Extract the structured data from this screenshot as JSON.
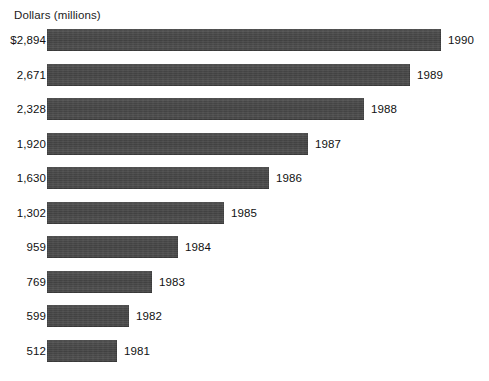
{
  "chart_data": {
    "type": "bar",
    "orientation": "horizontal",
    "title": "",
    "xlabel": "Dollars (millions)",
    "ylabel": "",
    "axis_title": "Dollars (millions)",
    "categories": [
      "1990",
      "1989",
      "1988",
      "1987",
      "1986",
      "1985",
      "1984",
      "1983",
      "1982",
      "1981"
    ],
    "values": [
      2894,
      2671,
      2328,
      1920,
      1630,
      1302,
      959,
      769,
      599,
      512
    ],
    "value_labels": [
      "$2,894",
      "2,671",
      "2,328",
      "1,920",
      "1,630",
      "1,302",
      "959",
      "769",
      "599",
      "512"
    ],
    "bar_labels": [
      "1990",
      "1989",
      "1988",
      "1987",
      "1986",
      "1985",
      "1984",
      "1983",
      "1982",
      "1981"
    ],
    "xlim": [
      0,
      2894
    ],
    "grid": false,
    "legend": null,
    "bar_color": "#4a4a4a",
    "text_color": "#111111",
    "background_color": "#ffffff"
  },
  "footnote": "",
  "series": [
    {
      "year": "1990",
      "value": 2894,
      "value_label": "$2,894",
      "bar_px": 394
    },
    {
      "year": "1989",
      "value": 2671,
      "value_label": "2,671",
      "bar_px": 363
    },
    {
      "year": "1988",
      "value": 2328,
      "value_label": "2,328",
      "bar_px": 317
    },
    {
      "year": "1987",
      "value": 1920,
      "value_label": "1,920",
      "bar_px": 261
    },
    {
      "year": "1986",
      "value": 1630,
      "value_label": "1,630",
      "bar_px": 222
    },
    {
      "year": "1985",
      "value": 1302,
      "value_label": "1,302",
      "bar_px": 177
    },
    {
      "year": "1984",
      "value": 959,
      "value_label": "959",
      "bar_px": 131
    },
    {
      "year": "1983",
      "value": 769,
      "value_label": "769",
      "bar_px": 105
    },
    {
      "year": "1982",
      "value": 599,
      "value_label": "599",
      "bar_px": 82
    },
    {
      "year": "1981",
      "value": 512,
      "value_label": "512",
      "bar_px": 70
    }
  ]
}
